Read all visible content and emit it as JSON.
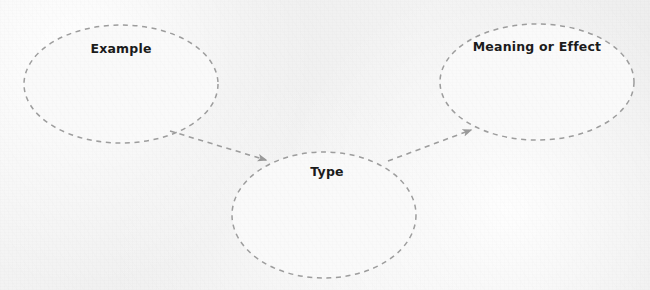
{
  "diagram": {
    "type": "concept-map",
    "canvas": {
      "width": 650,
      "height": 290
    },
    "background_color": "#f1f1f1",
    "stroke_color": "#9a9a9a",
    "fill_color": "#fafafa",
    "text_color": "#1b1b1b",
    "nodes": [
      {
        "id": "example",
        "label": "Example",
        "shape": "ellipse",
        "cx": 121,
        "cy": 84,
        "rx": 97,
        "ry": 59,
        "label_x": 121,
        "label_y": 41
      },
      {
        "id": "type",
        "label": "Type",
        "shape": "ellipse",
        "cx": 324,
        "cy": 215,
        "rx": 92,
        "ry": 63,
        "label_x": 327,
        "label_y": 164
      },
      {
        "id": "meaning-or-effect",
        "label": "Meaning or Effect",
        "shape": "ellipse",
        "cx": 537,
        "cy": 82,
        "rx": 97,
        "ry": 58,
        "label_x": 537,
        "label_y": 39
      }
    ],
    "edges": [
      {
        "id": "example-to-type",
        "from": "example",
        "to": "type",
        "label": "",
        "style": "dashed",
        "arrowhead": "filled-triangle",
        "x1": 170,
        "y1": 131,
        "x2": 266,
        "y2": 160
      },
      {
        "id": "type-to-meaning",
        "from": "type",
        "to": "meaning-or-effect",
        "label": "",
        "style": "dashed",
        "arrowhead": "filled-triangle",
        "x1": 388,
        "y1": 161,
        "x2": 471,
        "y2": 130
      }
    ]
  }
}
